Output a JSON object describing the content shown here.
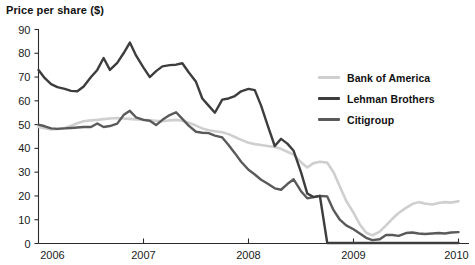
{
  "chart_data": {
    "type": "line",
    "title": "Price per share ($)",
    "xlabel": "",
    "ylabel": "Price per share ($)",
    "ylim": [
      0,
      90
    ],
    "xlim": [
      2006,
      2010
    ],
    "yticks": [
      0,
      10,
      20,
      30,
      40,
      50,
      60,
      70,
      80,
      90
    ],
    "xticks": [
      "2006",
      "2007",
      "2008",
      "2009",
      "2010"
    ],
    "grid": false,
    "legend_position": "right",
    "x": [
      2006.0,
      2006.06,
      2006.12,
      2006.18,
      2006.25,
      2006.31,
      2006.37,
      2006.43,
      2006.5,
      2006.56,
      2006.62,
      2006.68,
      2006.75,
      2006.81,
      2006.87,
      2006.93,
      2007.0,
      2007.06,
      2007.12,
      2007.18,
      2007.25,
      2007.31,
      2007.37,
      2007.43,
      2007.5,
      2007.56,
      2007.62,
      2007.68,
      2007.75,
      2007.81,
      2007.87,
      2007.93,
      2008.0,
      2008.06,
      2008.12,
      2008.18,
      2008.25,
      2008.31,
      2008.37,
      2008.43,
      2008.5,
      2008.56,
      2008.62,
      2008.68,
      2008.75,
      2008.81,
      2008.87,
      2008.93,
      2009.0,
      2009.06,
      2009.12,
      2009.18,
      2009.25,
      2009.31,
      2009.37,
      2009.43,
      2009.5,
      2009.56,
      2009.62,
      2009.68,
      2009.75,
      2009.81,
      2009.87,
      2009.93,
      2010.0
    ],
    "series": [
      {
        "name": "Bank of America",
        "color": "#cfcfcf",
        "values": [
          49.0,
          48.5,
          48.0,
          48.2,
          48.6,
          49.5,
          50.6,
          51.4,
          51.8,
          52.0,
          52.3,
          52.6,
          52.8,
          52.6,
          52.4,
          52.2,
          52.0,
          51.8,
          51.6,
          51.4,
          51.8,
          52.0,
          51.6,
          50.8,
          49.6,
          48.4,
          47.6,
          47.2,
          46.8,
          46.0,
          44.8,
          43.6,
          42.4,
          41.8,
          41.4,
          41.0,
          40.6,
          39.8,
          38.6,
          37.4,
          34.2,
          32.0,
          33.8,
          34.4,
          34.0,
          30.0,
          24.0,
          18.0,
          13.0,
          8.0,
          4.6,
          3.4,
          5.0,
          7.6,
          10.4,
          12.8,
          15.0,
          16.6,
          17.4,
          16.8,
          16.4,
          17.0,
          17.4,
          17.2,
          17.8
        ]
      },
      {
        "name": "Lehman Brothers",
        "color": "#3d3d3d",
        "values": [
          73.0,
          69.5,
          67.0,
          65.8,
          65.0,
          64.2,
          64.0,
          66.0,
          70.0,
          73.0,
          78.0,
          73.0,
          76.0,
          80.0,
          84.5,
          79.0,
          74.0,
          70.0,
          72.5,
          74.5,
          75.0,
          75.2,
          75.8,
          72.0,
          68.0,
          61.0,
          58.0,
          55.0,
          60.5,
          61.0,
          62.0,
          64.0,
          65.0,
          64.5,
          58.0,
          50.0,
          41.0,
          44.0,
          42.0,
          39.0,
          30.0,
          21.0,
          19.5,
          20.0,
          0.2,
          0.2,
          0.2,
          0.2,
          0.2,
          0.2,
          0.2,
          0.2,
          0.2,
          0.2,
          0.2,
          0.2,
          0.2,
          0.2,
          0.2,
          0.2,
          0.2,
          0.2,
          0.2,
          0.2,
          0.2
        ]
      },
      {
        "name": "Citigroup",
        "color": "#5a5a5a",
        "values": [
          50.0,
          49.3,
          48.4,
          48.2,
          48.4,
          48.6,
          48.8,
          49.0,
          49.0,
          50.5,
          49.0,
          49.4,
          50.4,
          54.0,
          55.8,
          53.0,
          52.0,
          51.6,
          49.8,
          52.0,
          54.0,
          55.2,
          52.4,
          49.6,
          47.0,
          46.6,
          46.4,
          45.4,
          44.6,
          41.4,
          38.0,
          34.4,
          31.0,
          29.0,
          26.8,
          25.2,
          23.2,
          22.6,
          25.0,
          27.0,
          22.0,
          19.0,
          19.5,
          20.0,
          19.8,
          14.0,
          10.0,
          7.6,
          6.0,
          4.2,
          2.4,
          1.4,
          1.8,
          3.6,
          3.6,
          3.2,
          4.4,
          4.6,
          4.2,
          4.0,
          4.2,
          4.4,
          4.2,
          4.6,
          4.8
        ]
      }
    ]
  },
  "legend": {
    "items": [
      {
        "label": "Bank of America",
        "color": "#cfcfcf"
      },
      {
        "label": "Lehman Brothers",
        "color": "#3d3d3d"
      },
      {
        "label": "Citigroup",
        "color": "#5a5a5a"
      }
    ]
  }
}
